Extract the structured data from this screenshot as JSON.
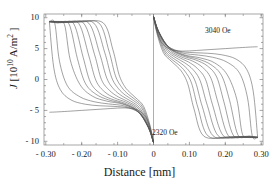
{
  "figure": {
    "axis_labels": {
      "x": "Distance [mm]",
      "y_symbol": "J",
      "y_unit_prefix": " [10",
      "y_unit_exp": "10",
      "y_unit_suffix": " A/m",
      "y_unit_suffix_exp": "2",
      "y_unit_close": " ]"
    },
    "annotations": [
      {
        "text": "3040 Oe",
        "x_px": 205,
        "y_px": 27
      },
      {
        "text": "2320 Oe",
        "x_px": 152,
        "y_px": 129
      }
    ]
  },
  "chart_data": {
    "type": "line",
    "title": "",
    "xlabel": "Distance [mm]",
    "ylabel": "J [10^10 A/m^2]",
    "xlim": [
      -0.305,
      0.305
    ],
    "ylim": [
      -10.6,
      10.6
    ],
    "xticks": [
      -0.3,
      -0.2,
      -0.1,
      0,
      0.1,
      0.2,
      0.3
    ],
    "xticklabels": [
      "- 0.30",
      "- 0.20",
      "- 0.10",
      "0",
      "0.10",
      "0.20",
      "0.30"
    ],
    "yticks": [
      -10,
      -5,
      0,
      5,
      10
    ],
    "yticklabels": [
      "- 10",
      "- 5",
      "0",
      "5",
      "10"
    ],
    "grid": false,
    "legend": "none",
    "series_note": "Current-density profiles across a strip at increasing applied field, from 2320 Oe to 3040 Oe. Left half and right half are related by 180-degree rotation about the origin.",
    "field_range_oe": [
      2320,
      3040
    ],
    "n_curves": 12,
    "series": [
      {
        "name": "2320 Oe",
        "x": [
          -0.29,
          -0.27,
          -0.24,
          -0.2,
          -0.16,
          -0.12,
          -0.08,
          -0.045,
          -0.02,
          -0.006,
          0.0
        ],
        "y": [
          -5.3,
          -5.25,
          -5.15,
          -5.0,
          -4.85,
          -4.7,
          -4.6,
          -4.9,
          -6.2,
          -8.6,
          -10.2
        ]
      },
      {
        "name": "2385 Oe",
        "x": [
          -0.29,
          -0.278,
          -0.26,
          -0.23,
          -0.19,
          -0.15,
          -0.11,
          -0.07,
          -0.035,
          -0.012,
          0.0
        ],
        "y": [
          9.3,
          2.0,
          -1.6,
          -3.3,
          -4.0,
          -4.25,
          -4.35,
          -4.6,
          -5.6,
          -8.0,
          -10.2
        ]
      },
      {
        "name": "2450 Oe",
        "x": [
          -0.29,
          -0.275,
          -0.262,
          -0.24,
          -0.205,
          -0.165,
          -0.125,
          -0.08,
          -0.04,
          -0.013,
          0.0
        ],
        "y": [
          9.32,
          9.1,
          3.0,
          -1.0,
          -2.8,
          -3.6,
          -3.95,
          -4.3,
          -5.4,
          -7.9,
          -10.2
        ]
      },
      {
        "name": "2515 Oe",
        "x": [
          -0.29,
          -0.268,
          -0.248,
          -0.232,
          -0.205,
          -0.17,
          -0.13,
          -0.085,
          -0.042,
          -0.014,
          0.0
        ],
        "y": [
          9.33,
          9.15,
          8.9,
          3.2,
          -0.8,
          -2.7,
          -3.5,
          -4.0,
          -5.2,
          -7.8,
          -10.2
        ]
      },
      {
        "name": "2580 Oe",
        "x": [
          -0.29,
          -0.262,
          -0.235,
          -0.212,
          -0.19,
          -0.16,
          -0.125,
          -0.085,
          -0.045,
          -0.015,
          0.0
        ],
        "y": [
          9.34,
          9.18,
          8.95,
          3.4,
          -0.6,
          -2.4,
          -3.3,
          -3.9,
          -5.1,
          -7.7,
          -10.2
        ]
      },
      {
        "name": "2645 Oe",
        "x": [
          -0.29,
          -0.255,
          -0.222,
          -0.196,
          -0.176,
          -0.15,
          -0.118,
          -0.082,
          -0.045,
          -0.015,
          0.0
        ],
        "y": [
          9.35,
          9.2,
          9.0,
          3.6,
          -0.4,
          -2.2,
          -3.15,
          -3.8,
          -5.0,
          -7.65,
          -10.2
        ]
      },
      {
        "name": "2710 Oe",
        "x": [
          -0.29,
          -0.248,
          -0.208,
          -0.18,
          -0.16,
          -0.136,
          -0.108,
          -0.076,
          -0.043,
          -0.015,
          0.0
        ],
        "y": [
          9.36,
          9.22,
          9.05,
          3.8,
          -0.2,
          -2.0,
          -3.0,
          -3.7,
          -4.9,
          -7.6,
          -10.2
        ]
      },
      {
        "name": "2775 Oe",
        "x": [
          -0.29,
          -0.24,
          -0.194,
          -0.164,
          -0.145,
          -0.122,
          -0.097,
          -0.07,
          -0.04,
          -0.014,
          0.0
        ],
        "y": [
          9.37,
          9.24,
          9.08,
          4.0,
          0.0,
          -1.8,
          -2.85,
          -3.6,
          -4.8,
          -7.55,
          -10.2
        ]
      },
      {
        "name": "2840 Oe",
        "x": [
          -0.29,
          -0.232,
          -0.18,
          -0.15,
          -0.13,
          -0.11,
          -0.087,
          -0.063,
          -0.037,
          -0.013,
          0.0
        ],
        "y": [
          9.38,
          9.26,
          9.1,
          4.2,
          0.2,
          -1.6,
          -2.7,
          -3.5,
          -4.7,
          -7.5,
          -10.2
        ]
      },
      {
        "name": "2905 Oe",
        "x": [
          -0.29,
          -0.224,
          -0.166,
          -0.136,
          -0.117,
          -0.098,
          -0.078,
          -0.056,
          -0.033,
          -0.012,
          0.0
        ],
        "y": [
          9.39,
          9.28,
          9.12,
          4.4,
          0.4,
          -1.45,
          -2.55,
          -3.4,
          -4.6,
          -7.45,
          -10.2
        ]
      },
      {
        "name": "2975 Oe",
        "x": [
          -0.29,
          -0.215,
          -0.152,
          -0.124,
          -0.106,
          -0.088,
          -0.07,
          -0.05,
          -0.03,
          -0.011,
          0.0
        ],
        "y": [
          9.4,
          9.3,
          9.14,
          4.6,
          0.6,
          -1.3,
          -2.4,
          -3.3,
          -4.5,
          -7.4,
          -10.2
        ]
      },
      {
        "name": "3040 Oe",
        "x": [
          -0.29,
          -0.206,
          -0.14,
          -0.113,
          -0.096,
          -0.08,
          -0.063,
          -0.045,
          -0.027,
          -0.01,
          0.0
        ],
        "y": [
          9.42,
          9.32,
          9.16,
          4.8,
          0.8,
          -1.15,
          -2.25,
          -3.2,
          -4.4,
          -7.35,
          -10.2
        ]
      }
    ]
  }
}
